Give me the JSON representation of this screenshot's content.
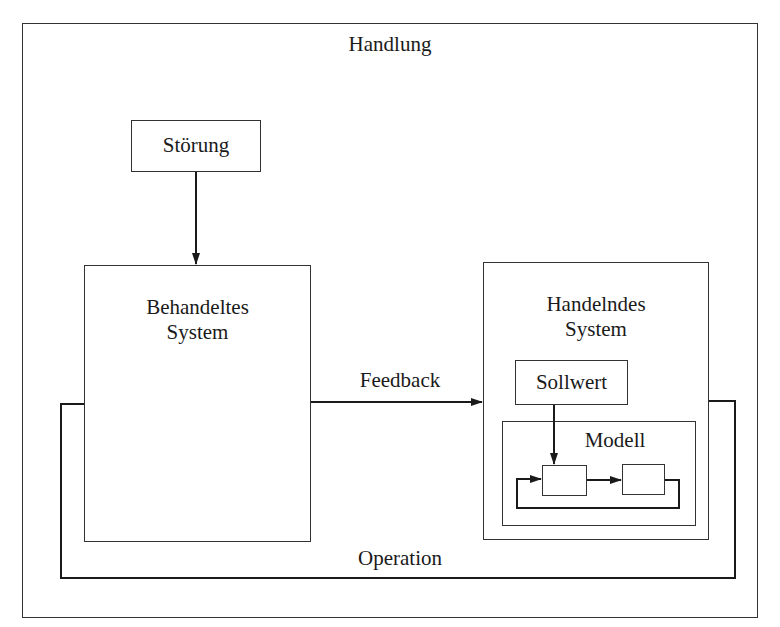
{
  "diagram": {
    "title": "Handlung",
    "nodes": {
      "stoerung": {
        "label": "Störung"
      },
      "behandeltes_system": {
        "line1": "Behandeltes",
        "line2": "System"
      },
      "handelndes_system": {
        "line1": "Handelndes",
        "line2": "System"
      },
      "sollwert": {
        "label": "Sollwert"
      },
      "modell": {
        "label": "Modell"
      },
      "modell_block_1": {
        "label": ""
      },
      "modell_block_2": {
        "label": ""
      }
    },
    "edges": {
      "feedback": {
        "label": "Feedback",
        "from": "Behandeltes System",
        "to": "Handelndes System"
      },
      "operation": {
        "label": "Operation",
        "from": "Handelndes System",
        "to": "Behandeltes System"
      },
      "disturbance": {
        "label": "",
        "from": "Störung",
        "to": "Behandeltes System"
      },
      "setpoint": {
        "label": "",
        "from": "Sollwert",
        "to": "Modell block 1"
      },
      "model_forward": {
        "label": "",
        "from": "Modell block 1",
        "to": "Modell block 2"
      },
      "model_loop": {
        "label": "",
        "from": "Modell block 2",
        "to": "Modell block 1"
      }
    },
    "colors": {
      "line": "#1a1a1a",
      "box_border": "#333333",
      "background": "#ffffff"
    }
  }
}
